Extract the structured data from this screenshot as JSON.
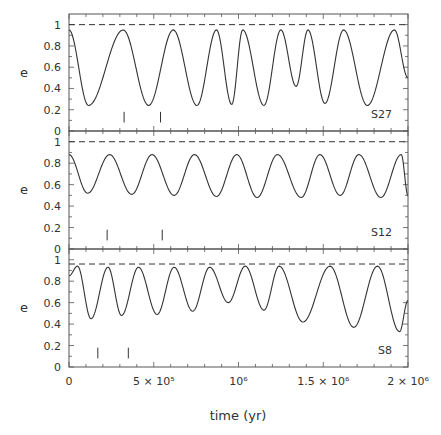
{
  "chart_data": {
    "type": "line",
    "xlabel": "time (yr)",
    "xlim": [
      0,
      2000000
    ],
    "xticks": [
      {
        "value": 0,
        "label": "0"
      },
      {
        "value": 500000,
        "label": "5 × 10⁵"
      },
      {
        "value": 1000000,
        "label": "10⁶"
      },
      {
        "value": 1500000,
        "label": "1.5 × 10⁶"
      },
      {
        "value": 2000000,
        "label": "2 × 10⁶"
      }
    ],
    "panels": [
      {
        "name": "S27",
        "ylabel": "e",
        "ylim": [
          0,
          1.1
        ],
        "yticks": [
          "0",
          "0.2",
          "0.4",
          "0.6",
          "0.8",
          "1"
        ],
        "reference_line": {
          "y": 1.0,
          "style": "dashed"
        },
        "markers_x": [
          325000,
          540000
        ],
        "series": {
          "name": "S27 eccentricity",
          "extrema": [
            [
              0,
              0.95
            ],
            [
              115000,
              0.24
            ],
            [
              320000,
              0.95
            ],
            [
              470000,
              0.24
            ],
            [
              615000,
              0.95
            ],
            [
              755000,
              0.24
            ],
            [
              870000,
              0.95
            ],
            [
              960000,
              0.25
            ],
            [
              1025000,
              0.95
            ],
            [
              1150000,
              0.24
            ],
            [
              1250000,
              0.95
            ],
            [
              1340000,
              0.42
            ],
            [
              1410000,
              0.95
            ],
            [
              1510000,
              0.26
            ],
            [
              1620000,
              0.95
            ],
            [
              1760000,
              0.24
            ],
            [
              1920000,
              0.95
            ],
            [
              2000000,
              0.5
            ]
          ]
        }
      },
      {
        "name": "S12",
        "ylabel": "e",
        "ylim": [
          0,
          1.1
        ],
        "yticks": [
          "0",
          "0.2",
          "0.4",
          "0.6",
          "0.8",
          "1"
        ],
        "reference_line": {
          "y": 1.0,
          "style": "dashed"
        },
        "markers_x": [
          225000,
          550000
        ],
        "series": {
          "name": "S12 eccentricity",
          "extrema": [
            [
              0,
              0.88
            ],
            [
              110000,
              0.52
            ],
            [
              240000,
              0.88
            ],
            [
              370000,
              0.51
            ],
            [
              490000,
              0.88
            ],
            [
              620000,
              0.5
            ],
            [
              740000,
              0.88
            ],
            [
              870000,
              0.49
            ],
            [
              990000,
              0.88
            ],
            [
              1110000,
              0.48
            ],
            [
              1230000,
              0.88
            ],
            [
              1370000,
              0.48
            ],
            [
              1480000,
              0.88
            ],
            [
              1600000,
              0.5
            ],
            [
              1710000,
              0.88
            ],
            [
              1840000,
              0.48
            ],
            [
              1960000,
              0.88
            ],
            [
              2000000,
              0.5
            ]
          ]
        }
      },
      {
        "name": "S8",
        "ylabel": "e",
        "ylim": [
          0,
          1.1
        ],
        "yticks": [
          "0",
          "0.2",
          "0.4",
          "0.6",
          "0.8",
          "1"
        ],
        "reference_line": {
          "y": 0.96,
          "style": "dashed"
        },
        "markers_x": [
          170000,
          350000
        ],
        "series": {
          "name": "S8 eccentricity",
          "extrema": [
            [
              0,
              0.85
            ],
            [
              50000,
              0.94
            ],
            [
              130000,
              0.45
            ],
            [
              230000,
              0.93
            ],
            [
              310000,
              0.48
            ],
            [
              410000,
              0.93
            ],
            [
              520000,
              0.49
            ],
            [
              620000,
              0.93
            ],
            [
              730000,
              0.52
            ],
            [
              830000,
              0.93
            ],
            [
              940000,
              0.6
            ],
            [
              1040000,
              0.94
            ],
            [
              1150000,
              0.53
            ],
            [
              1240000,
              0.94
            ],
            [
              1380000,
              0.42
            ],
            [
              1540000,
              0.94
            ],
            [
              1680000,
              0.37
            ],
            [
              1820000,
              0.94
            ],
            [
              1950000,
              0.33
            ],
            [
              2000000,
              0.62
            ]
          ]
        }
      }
    ]
  }
}
